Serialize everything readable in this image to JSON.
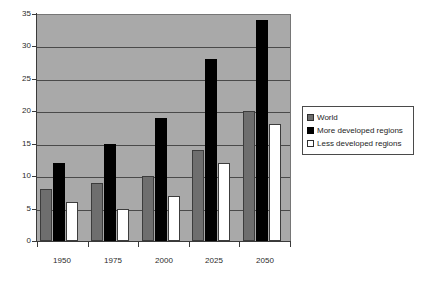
{
  "chart_data": {
    "type": "bar",
    "title": "",
    "subtitle": "",
    "xlabel": "",
    "ylabel": "",
    "categories": [
      "1950",
      "1975",
      "2000",
      "2025",
      "2050"
    ],
    "series": [
      {
        "name": "World",
        "values": [
          8,
          9,
          10,
          14,
          20
        ],
        "color": "#6e6e6e"
      },
      {
        "name": "More developed regions",
        "values": [
          12,
          15,
          19,
          28,
          34
        ],
        "color": "#000000"
      },
      {
        "name": "Less developed regions",
        "values": [
          6,
          5,
          7,
          12,
          18
        ],
        "color": "#ffffff"
      }
    ],
    "ylim": [
      0,
      35
    ],
    "yticks": [
      0,
      5,
      10,
      15,
      20,
      25,
      30,
      35
    ],
    "ytick_labels": [
      "0",
      "5",
      "10",
      "15",
      "20",
      "25",
      "30",
      "35"
    ],
    "grid": true,
    "grid_axis": "y",
    "legend_position": "right",
    "plot_background": "#a9a9a9",
    "gridline_color": "#4a4a4a",
    "axis_color": "#3a3a3a"
  },
  "legend": {
    "items": [
      {
        "label": "World",
        "swatch": "world"
      },
      {
        "label": "More developed regions",
        "swatch": "more"
      },
      {
        "label": "Less developed regions",
        "swatch": "less"
      }
    ]
  }
}
